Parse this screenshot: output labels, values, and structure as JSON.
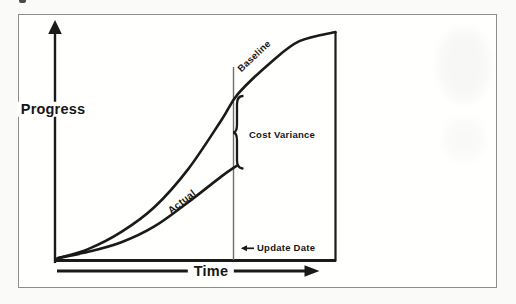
{
  "figure": {
    "colors": {
      "line": "#1a1a1a",
      "frame_border": "#8d8d8d",
      "update_line": "#6e6e6e",
      "background": "#fffffe",
      "page_background": "#fafaf8"
    }
  },
  "chart_data": {
    "type": "line",
    "title": "",
    "xlabel": "Time",
    "ylabel": "Progress",
    "xlim": [
      0,
      1
    ],
    "ylim": [
      0,
      1
    ],
    "grid": false,
    "legend": "labels-on-curves",
    "series": [
      {
        "name": "Baseline",
        "x": [
          0,
          0.11,
          0.23,
          0.35,
          0.47,
          0.59,
          0.65,
          0.77,
          0.87,
          1.0
        ],
        "y": [
          0.01,
          0.05,
          0.125,
          0.235,
          0.4,
          0.615,
          0.73,
          0.87,
          0.96,
          1.0
        ]
      },
      {
        "name": "Actual",
        "x": [
          0,
          0.11,
          0.23,
          0.35,
          0.47,
          0.59,
          0.645
        ],
        "y": [
          0.01,
          0.038,
          0.08,
          0.15,
          0.255,
          0.368,
          0.415
        ]
      }
    ],
    "annotations": [
      {
        "type": "brace",
        "label": "Cost Variance",
        "x": 0.645,
        "y_from": 0.415,
        "y_to": 0.73
      },
      {
        "type": "vline",
        "label": "Update Date",
        "x": 0.635
      },
      {
        "type": "vline",
        "label": "",
        "x": 1.0
      }
    ]
  }
}
